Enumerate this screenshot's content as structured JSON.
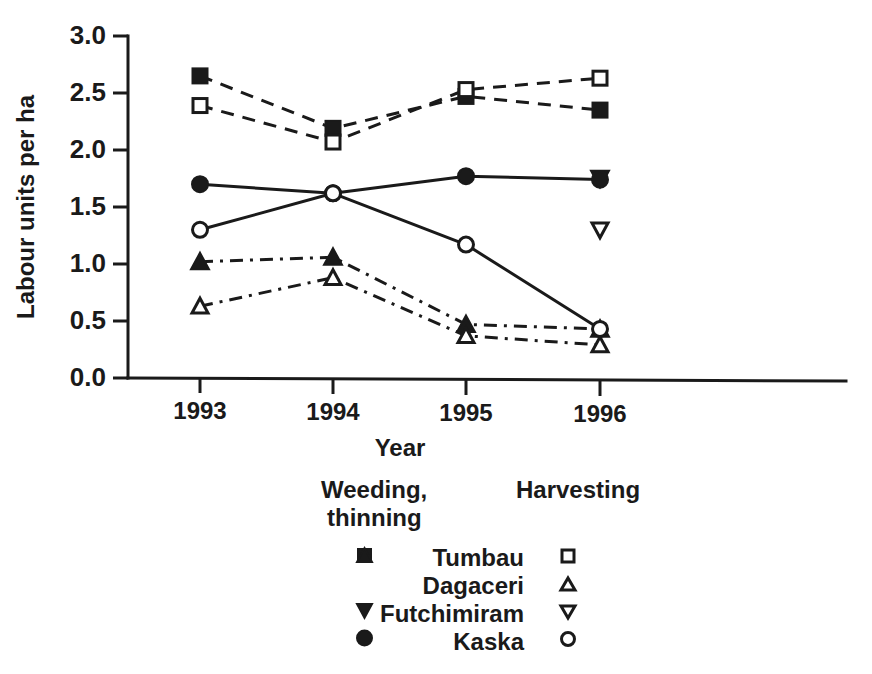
{
  "chart_data": {
    "type": "line",
    "title": "",
    "xlabel": "Year",
    "ylabel": "Labour units per ha",
    "categories": [
      "1993",
      "1994",
      "1995",
      "1996"
    ],
    "x": [
      1993,
      1994,
      1995,
      1996
    ],
    "ylim": [
      0.0,
      3.0
    ],
    "ytick_labels": [
      "0.0",
      "0.5",
      "1.0",
      "1.5",
      "2.0",
      "2.5",
      "3.0"
    ],
    "ytick_values": [
      0.0,
      0.5,
      1.0,
      1.5,
      2.0,
      2.5,
      3.0
    ],
    "grid": false,
    "legend_position": "bottom",
    "series": [
      {
        "name": "Tumbau",
        "activity": "Weeding, thinning",
        "marker": "filled-square",
        "linestyle": "dashed",
        "values": [
          2.65,
          2.19,
          2.47,
          2.35
        ]
      },
      {
        "name": "Tumbau",
        "activity": "Harvesting",
        "marker": "open-square",
        "linestyle": "dashed",
        "values": [
          2.39,
          2.07,
          2.53,
          2.63
        ]
      },
      {
        "name": "Dagaceri",
        "activity": "Weeding, thinning",
        "marker": "filled-up-triangle",
        "linestyle": "dash-dot",
        "values": [
          1.02,
          1.06,
          0.47,
          0.43
        ]
      },
      {
        "name": "Dagaceri",
        "activity": "Harvesting",
        "marker": "open-up-triangle",
        "linestyle": "dash-dot",
        "values": [
          0.63,
          0.88,
          0.37,
          0.29
        ]
      },
      {
        "name": "Futchimiram",
        "activity": "Weeding, thinning",
        "marker": "filled-down-triangle",
        "linestyle": "none",
        "values": [
          null,
          null,
          null,
          1.75
        ]
      },
      {
        "name": "Futchimiram",
        "activity": "Harvesting",
        "marker": "open-down-triangle",
        "linestyle": "none",
        "values": [
          null,
          null,
          null,
          1.3
        ]
      },
      {
        "name": "Kaska",
        "activity": "Weeding, thinning",
        "marker": "filled-circle",
        "linestyle": "solid",
        "values": [
          1.7,
          1.62,
          1.77,
          1.74
        ]
      },
      {
        "name": "Kaska",
        "activity": "Harvesting",
        "marker": "open-circle",
        "linestyle": "solid",
        "values": [
          1.3,
          1.62,
          1.17,
          0.43
        ]
      }
    ]
  },
  "axes": {
    "ylabel": "Labour units per ha",
    "xlabel": "Year",
    "yticks": [
      "3.0",
      "2.5",
      "2.0",
      "1.5",
      "1.0",
      "0.5",
      "0.0"
    ],
    "xticks": [
      "1993",
      "1994",
      "1995",
      "1996"
    ]
  },
  "legend": {
    "heading_left_line1": "Weeding,",
    "heading_left_line2": "thinning",
    "heading_right": "Harvesting",
    "rows": [
      {
        "label": "Tumbau",
        "filled_marker": "filled-square-icon",
        "open_marker": "open-square-icon"
      },
      {
        "label": "Dagaceri",
        "filled_marker": "filled-up-triangle-icon",
        "open_marker": "open-up-triangle-icon"
      },
      {
        "label": "Futchimiram",
        "filled_marker": "filled-down-triangle-icon",
        "open_marker": "open-down-triangle-icon"
      },
      {
        "label": "Kaska",
        "filled_marker": "filled-circle-icon",
        "open_marker": "open-circle-icon"
      }
    ]
  },
  "colors": {
    "ink": "#1a1a1a",
    "background": "#ffffff"
  }
}
